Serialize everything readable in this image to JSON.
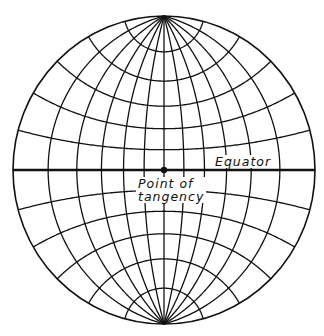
{
  "diagram": {
    "projection": "stereographic-equatorial",
    "labels": {
      "equator": "Equator",
      "tangency_line1": "Point of",
      "tangency_line2": "tangency"
    },
    "geometry": {
      "center_x": 164,
      "center_y": 170,
      "radius_x": 151,
      "radius_y": 154
    },
    "graticule": {
      "meridian_spacing_deg": 15,
      "parallel_spacing_deg": 15,
      "meridians_deg": [
        -90,
        -75,
        -60,
        -45,
        -30,
        -15,
        0,
        15,
        30,
        45,
        60,
        75,
        90
      ],
      "parallels_deg": [
        -75,
        -60,
        -45,
        -30,
        -15,
        0,
        15,
        30,
        45,
        60,
        75
      ]
    },
    "colors": {
      "line": "#111111",
      "background": "#ffffff"
    }
  }
}
